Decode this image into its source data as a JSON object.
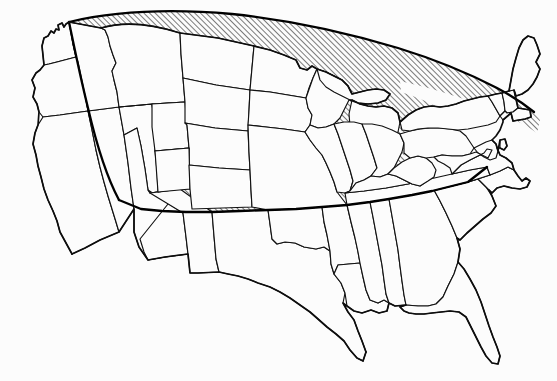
{
  "figure": {
    "type": "thematic-choropleth-outline-map",
    "title": "",
    "subtitle": "",
    "caption": "",
    "region_label": "",
    "legend_present": false,
    "labels_present": false,
    "background_color": "#fcfcfc",
    "line_color": "#111111",
    "hatch_color": "#1a1a1a",
    "hatch_angle_degrees": 45,
    "hatch_spacing_px": 4,
    "state_border_width_px": 1.15,
    "region_border_width_px": 2.3,
    "nation_border_width_px": 1.7
  },
  "map": {
    "name": "contiguous-united-states",
    "projection_hint": "conic",
    "width_px": 557,
    "height_px": 381,
    "states_shown_count": 48,
    "highlighted_count": 26,
    "unhighlighted_count": 22
  },
  "chart_data": {
    "type": "map",
    "title": "",
    "xlabel": "",
    "ylabel": "",
    "categories": [
      "highlighted",
      "not highlighted"
    ],
    "values": [
      26,
      22
    ],
    "encoding": "diagonal-hatch-fill",
    "highlighted_states": [
      "Montana",
      "Idaho",
      "Wyoming",
      "North Dakota",
      "South Dakota",
      "Nebraska",
      "Colorado",
      "Kansas",
      "Minnesota",
      "Iowa",
      "Missouri",
      "Wisconsin",
      "Illinois",
      "Michigan",
      "Indiana",
      "Ohio",
      "Kentucky",
      "West Virginia",
      "Pennsylvania",
      "New York",
      "Maryland",
      "New Jersey",
      "Vermont",
      "New Hampshire",
      "Maine",
      "Massachusetts"
    ],
    "unhighlighted_states": [
      "Washington",
      "Oregon",
      "California",
      "Nevada",
      "Utah",
      "Arizona",
      "New Mexico",
      "Texas",
      "Oklahoma",
      "Arkansas",
      "Louisiana",
      "Mississippi",
      "Alabama",
      "Tennessee",
      "Georgia",
      "Florida",
      "South Carolina",
      "North Carolina",
      "Virginia",
      "Delaware",
      "Connecticut",
      "Rhode Island"
    ],
    "partially_highlighted_states": [
      "Utah",
      "Idaho"
    ]
  },
  "accessibility": {
    "alt_text": "Outline map of the contiguous United States showing state borders; a large northern region covering the Upper Midwest, Northern Plains, Northern Rockies and Northeast is filled with diagonal hatching and outlined by a heavy curved boundary."
  }
}
